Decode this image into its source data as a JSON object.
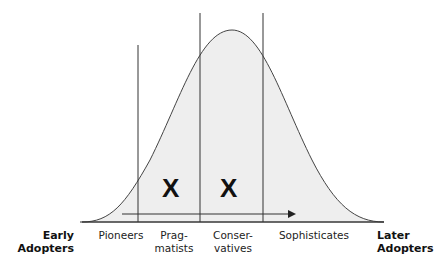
{
  "diagram": {
    "type": "bell-curve-adoption",
    "left_end_label": [
      "Early",
      "Adopters"
    ],
    "right_end_label": [
      "Later",
      "Adopters"
    ],
    "segments": [
      {
        "label_lines": [
          "Pioneers"
        ]
      },
      {
        "label_lines": [
          "Prag-",
          "matists"
        ]
      },
      {
        "label_lines": [
          "Conser-",
          "vatives"
        ]
      },
      {
        "label_lines": [
          "Sophisticates"
        ]
      }
    ],
    "markers": [
      {
        "glyph": "X",
        "segment": "Pragmatists"
      },
      {
        "glyph": "X",
        "segment": "Conservatives"
      }
    ],
    "arrow": "left-to-right",
    "colors": {
      "fill": "#eeeeee",
      "stroke": "#333333"
    }
  }
}
